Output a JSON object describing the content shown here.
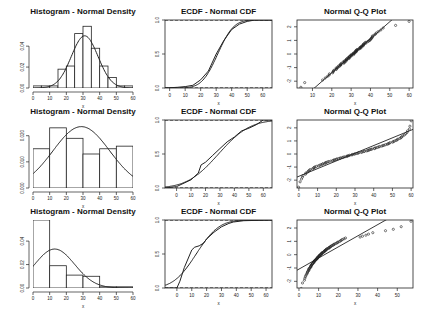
{
  "layout": {
    "rows": 3,
    "cols": 3
  },
  "chart_data": [
    {
      "type": "histogram",
      "panel": "row1-col1",
      "title": "Histogram - Normal Density",
      "xlabel": "x",
      "ylabel": "",
      "xlim": [
        0,
        60
      ],
      "ylim": [
        0,
        0.065
      ],
      "xticks": [
        0,
        10,
        20,
        30,
        40,
        50,
        60
      ],
      "yticks": [
        0.0,
        0.02,
        0.04
      ],
      "ytick_labels": [
        "0.00",
        "0.02",
        "0.04"
      ],
      "bins": [
        [
          0,
          5
        ],
        [
          5,
          10
        ],
        [
          10,
          15
        ],
        [
          15,
          20
        ],
        [
          20,
          25
        ],
        [
          25,
          30
        ],
        [
          30,
          35
        ],
        [
          35,
          40
        ],
        [
          40,
          45
        ],
        [
          45,
          50
        ],
        [
          50,
          55
        ],
        [
          55,
          60
        ]
      ],
      "densities": [
        0.002,
        0.002,
        0.002,
        0.018,
        0.021,
        0.052,
        0.059,
        0.038,
        0.021,
        0.01,
        0.002,
        0.002
      ],
      "overlay": {
        "type": "normal_density",
        "mean": 31,
        "sd": 8
      }
    },
    {
      "type": "line",
      "panel": "row1-col2",
      "title": "ECDF - Normal CDF",
      "xlabel": "x",
      "xlim": [
        -3,
        66
      ],
      "ylim": [
        0,
        1
      ],
      "xticks": [
        0,
        10,
        20,
        30,
        40,
        50,
        60
      ],
      "yticks": [
        0.0,
        0.5,
        1.0
      ],
      "ytick_labels": [
        "0.0",
        "0.5",
        "1.0"
      ],
      "hlines_dashed": [
        0,
        1
      ],
      "series": [
        {
          "name": "ECDF",
          "x": [
            -3,
            5,
            10,
            15,
            20,
            25,
            30,
            35,
            40,
            45,
            50,
            55,
            66
          ],
          "values": [
            0,
            0.01,
            0.02,
            0.04,
            0.12,
            0.25,
            0.5,
            0.7,
            0.86,
            0.94,
            0.98,
            1.0,
            1.0
          ]
        },
        {
          "name": "Normal CDF",
          "mean": 31,
          "sd": 8
        }
      ]
    },
    {
      "type": "scatter",
      "panel": "row1-col3",
      "title": "Normal Q-Q Plot",
      "xlabel": "x",
      "xlim": [
        2,
        62
      ],
      "ylim": [
        -2.5,
        2.5
      ],
      "xticks": [
        10,
        20,
        30,
        40,
        50,
        60
      ],
      "yticks": [
        -2,
        -1,
        0,
        1,
        2
      ],
      "ytick_labels": [
        "-2",
        "-1",
        "0",
        "1",
        "2"
      ],
      "reference_line": {
        "mean": 31,
        "sd": 8
      },
      "points_desc": "approx linear, outliers at (4,-2.5),(6,-2.1),(53,2.1),(60,2.4)"
    },
    {
      "type": "histogram",
      "panel": "row2-col1",
      "title": "Histogram - Normal Density",
      "xlabel": "x",
      "xlim": [
        0,
        60
      ],
      "ylim": [
        0,
        0.026
      ],
      "xticks": [
        0,
        10,
        20,
        30,
        40,
        50,
        60
      ],
      "yticks": [
        0.0,
        0.01,
        0.02
      ],
      "ytick_labels": [
        "0.000",
        "0.010",
        "0.020"
      ],
      "bins": [
        [
          0,
          10
        ],
        [
          10,
          20
        ],
        [
          20,
          30
        ],
        [
          30,
          40
        ],
        [
          40,
          50
        ],
        [
          50,
          60
        ]
      ],
      "densities": [
        0.015,
        0.023,
        0.019,
        0.013,
        0.015,
        0.016
      ],
      "overlay": {
        "type": "normal_density",
        "mean": 29,
        "sd": 17
      }
    },
    {
      "type": "line",
      "panel": "row2-col2",
      "title": "ECDF - Normal CDF",
      "xlabel": "x",
      "xlim": [
        -8,
        66
      ],
      "ylim": [
        0,
        1
      ],
      "xticks": [
        0,
        10,
        20,
        30,
        40,
        50,
        60
      ],
      "yticks": [
        0.0,
        0.5,
        1.0
      ],
      "ytick_labels": [
        "0.0",
        "0.5",
        "1.0"
      ],
      "hlines_dashed": [
        0,
        1
      ],
      "series": [
        {
          "name": "ECDF",
          "x": [
            -8,
            0,
            10,
            15,
            17,
            20,
            25,
            30,
            35,
            40,
            45,
            50,
            55,
            60,
            66
          ],
          "values": [
            0,
            0.02,
            0.12,
            0.22,
            0.34,
            0.38,
            0.48,
            0.58,
            0.68,
            0.75,
            0.84,
            0.88,
            0.93,
            1.0,
            1.0
          ]
        },
        {
          "name": "Normal CDF",
          "mean": 29,
          "sd": 17
        }
      ]
    },
    {
      "type": "scatter",
      "panel": "row2-col3",
      "title": "Normal Q-Q Plot",
      "xlabel": "x",
      "xlim": [
        -1,
        61
      ],
      "ylim": [
        -2.6,
        2.6
      ],
      "xticks": [
        0,
        10,
        20,
        30,
        40,
        50,
        60
      ],
      "yticks": [
        -2,
        -1,
        0,
        1,
        2
      ],
      "ytick_labels": [
        "-2",
        "-1",
        "0",
        "1",
        "2"
      ],
      "reference_line": {
        "mean": 29,
        "sd": 17
      },
      "points_desc": "S-shaped, uniform-like distribution"
    },
    {
      "type": "histogram",
      "panel": "row3-col1",
      "title": "Histogram - Normal Density",
      "xlabel": "x",
      "xlim": [
        0,
        60
      ],
      "ylim": [
        0,
        0.058
      ],
      "xticks": [
        0,
        10,
        20,
        30,
        40,
        50,
        60
      ],
      "yticks": [
        0.0,
        0.02,
        0.04
      ],
      "ytick_labels": [
        "0.00",
        "0.02",
        "0.04"
      ],
      "bins": [
        [
          0,
          10
        ],
        [
          10,
          20
        ],
        [
          20,
          30
        ],
        [
          30,
          40
        ],
        [
          40,
          50
        ],
        [
          50,
          60
        ]
      ],
      "densities": [
        0.058,
        0.019,
        0.011,
        0.01,
        0.001,
        0.001
      ],
      "overlay": {
        "type": "normal_density",
        "mean": 13,
        "sd": 12
      }
    },
    {
      "type": "line",
      "panel": "row3-col2",
      "title": "ECDF - Normal CDF",
      "xlabel": "x",
      "xlim": [
        -8,
        64
      ],
      "ylim": [
        0,
        1
      ],
      "xticks": [
        0,
        10,
        20,
        30,
        40,
        50,
        60
      ],
      "yticks": [
        0.0,
        0.5,
        1.0
      ],
      "ytick_labels": [
        "0.0",
        "0.5",
        "1.0"
      ],
      "hlines_dashed": [
        0,
        1
      ],
      "series": [
        {
          "name": "ECDF",
          "x": [
            -8,
            0,
            2,
            5,
            10,
            12,
            15,
            18,
            20,
            25,
            30,
            35,
            38,
            45,
            64
          ],
          "values": [
            0,
            0,
            0.1,
            0.3,
            0.56,
            0.6,
            0.62,
            0.66,
            0.72,
            0.82,
            0.9,
            0.95,
            0.97,
            0.99,
            1.0
          ]
        },
        {
          "name": "Normal CDF",
          "mean": 13,
          "sd": 12
        }
      ]
    },
    {
      "type": "scatter",
      "panel": "row3-col3",
      "title": "Normal Q-Q Plot",
      "xlabel": "x",
      "xlim": [
        -1,
        58
      ],
      "ylim": [
        -2.5,
        2.6
      ],
      "xticks": [
        0,
        10,
        20,
        30,
        40,
        50
      ],
      "yticks": [
        -2,
        -1,
        0,
        1,
        2
      ],
      "ytick_labels": [
        "-2",
        "-1",
        "0",
        "1",
        "2"
      ],
      "reference_line": {
        "mean": 13,
        "sd": 12
      },
      "points_desc": "right-skewed, concave; outliers at (44,1.8),(48,1.9),(52,2.1),(57,2.5)"
    }
  ]
}
